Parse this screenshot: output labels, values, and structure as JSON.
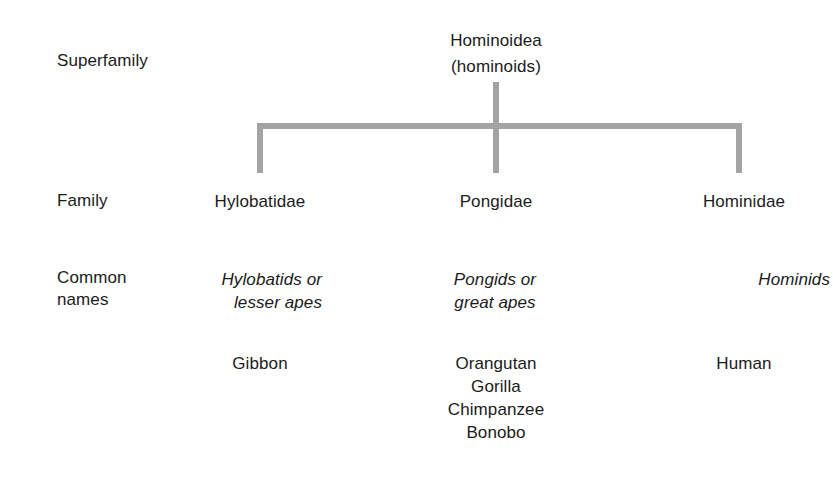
{
  "diagram": {
    "type": "taxonomic-hierarchy",
    "connector_color": "#a3a3a3",
    "text_color": "#1b1b1b",
    "background_color": "#ffffff"
  },
  "rank_labels": {
    "superfamily": "Superfamily",
    "family": "Family",
    "common_names": "Common\nnames"
  },
  "root": {
    "scientific_name": "Hominoidea",
    "common_name": "(hominoids)",
    "text": "Hominoidea\n(hominoids)"
  },
  "columns": [
    {
      "family": "Hylobatidae",
      "common_names_italic": "Hylobatids or\nlesser apes",
      "species": "Gibbon"
    },
    {
      "family": "Pongidae",
      "common_names_italic": "Pongids or\ngreat apes",
      "species": "Orangutan\nGorilla\nChimpanzee\nBonobo"
    },
    {
      "family": "Hominidae",
      "common_names_italic": "Hominids",
      "species": "Human"
    }
  ]
}
